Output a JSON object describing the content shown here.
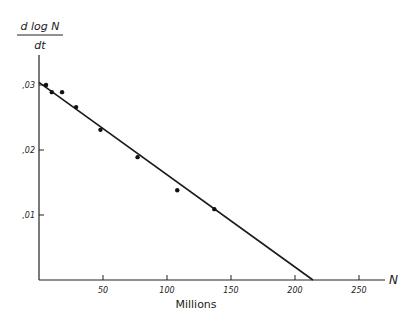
{
  "chart_data": {
    "type": "scatter",
    "title": "",
    "ylabel": {
      "numerator": "d log N",
      "denominator": "dt"
    },
    "xlabel": "Millions",
    "x_axis_end_label": "N",
    "xlim": [
      0,
      270
    ],
    "ylim": [
      0,
      0.035
    ],
    "x_ticks": [
      {
        "value": 50,
        "label": "50"
      },
      {
        "value": 100,
        "label": "100"
      },
      {
        "value": 150,
        "label": "150"
      },
      {
        "value": 200,
        "label": "200"
      },
      {
        "value": 250,
        "label": "250"
      }
    ],
    "y_ticks": [
      {
        "value": 0.01,
        "label": ",01"
      },
      {
        "value": 0.02,
        "label": ",02"
      },
      {
        "value": 0.03,
        "label": ",03"
      }
    ],
    "grid": false,
    "series": [
      {
        "name": "observed",
        "points": [
          {
            "x": 5.5,
            "y": 0.03
          },
          {
            "x": 10,
            "y": 0.0289
          },
          {
            "x": 18,
            "y": 0.0289
          },
          {
            "x": 29,
            "y": 0.0266
          },
          {
            "x": 48,
            "y": 0.0231
          },
          {
            "x": 77,
            "y": 0.0189
          },
          {
            "x": 108,
            "y": 0.0138
          },
          {
            "x": 137,
            "y": 0.0109
          }
        ]
      }
    ],
    "fit_line": {
      "start": {
        "x": 0,
        "y": 0.0304
      },
      "end": {
        "x": 214,
        "y": 0
      }
    }
  }
}
